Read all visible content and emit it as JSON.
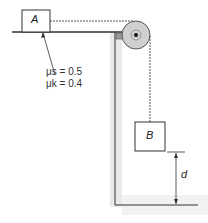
{
  "diagram": {
    "block_a": {
      "label": "A"
    },
    "block_b": {
      "label": "B"
    },
    "coefficients": {
      "static": "μs = 0.5",
      "kinetic": "μk = 0.4"
    },
    "dimension": {
      "label": "d"
    },
    "colors": {
      "line": "#333333",
      "block_fill": "#ffffff",
      "wall_shade": "#e6e6e6",
      "pulley": "#cfcfcf",
      "rope": "#555555"
    }
  }
}
